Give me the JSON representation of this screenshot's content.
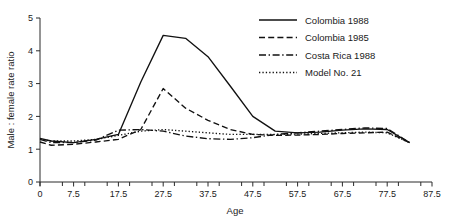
{
  "chart_data": {
    "type": "line",
    "title": "",
    "xlabel": "Age",
    "ylabel": "Male : female rate ratio",
    "xlim": [
      0,
      87.5
    ],
    "ylim": [
      0,
      5
    ],
    "grid": false,
    "legend_position": "top-right",
    "x_ticks": [
      0,
      7.5,
      17.5,
      27.5,
      37.5,
      47.5,
      57.5,
      67.5,
      77.5,
      87.5
    ],
    "x_tick_labels": [
      "0",
      "7.5",
      "17.5",
      "27.5",
      "37.5",
      "47.5",
      "57.5",
      "67.5",
      "77.5",
      "87.5"
    ],
    "y_ticks": [
      0,
      1,
      2,
      3,
      4,
      5
    ],
    "y_tick_labels": [
      "0",
      "1",
      "2",
      "3",
      "4",
      "5"
    ],
    "x": [
      0,
      2.5,
      7.5,
      12.5,
      17.5,
      22.5,
      27.5,
      32.5,
      37.5,
      42.5,
      47.5,
      52.5,
      57.5,
      62.5,
      67.5,
      72.5,
      77.5,
      82.5
    ],
    "series": [
      {
        "name": "Colombia 1988",
        "style": "solid",
        "values": [
          1.33,
          1.25,
          1.2,
          1.3,
          1.45,
          3.05,
          4.47,
          4.38,
          3.82,
          2.92,
          2.0,
          1.55,
          1.5,
          1.52,
          1.58,
          1.62,
          1.6,
          1.2
        ]
      },
      {
        "name": "Colombia 1985",
        "style": "dashed",
        "values": [
          1.22,
          1.12,
          1.15,
          1.22,
          1.3,
          1.6,
          2.85,
          2.25,
          1.88,
          1.6,
          1.45,
          1.42,
          1.43,
          1.45,
          1.48,
          1.5,
          1.52,
          1.2
        ]
      },
      {
        "name": "Costa Rica 1988",
        "style": "dashdot",
        "values": [
          1.3,
          1.2,
          1.2,
          1.28,
          1.58,
          1.6,
          1.55,
          1.4,
          1.32,
          1.3,
          1.35,
          1.45,
          1.5,
          1.55,
          1.6,
          1.65,
          1.63,
          1.2
        ]
      },
      {
        "name": "Model No. 21",
        "style": "dotted",
        "values": [
          1.3,
          1.25,
          1.25,
          1.3,
          1.42,
          1.55,
          1.6,
          1.55,
          1.5,
          1.45,
          1.45,
          1.45,
          1.46,
          1.48,
          1.5,
          1.52,
          1.5,
          1.2
        ]
      }
    ],
    "colors": {
      "line": "#111111",
      "axis": "#2b2b2b",
      "background": "#ffffff"
    }
  }
}
